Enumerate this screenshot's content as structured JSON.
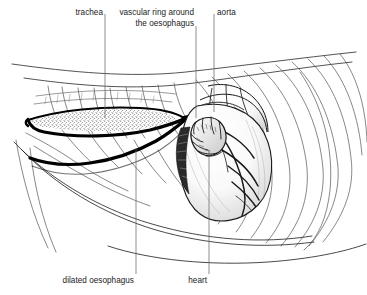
{
  "figure": {
    "background_color": "#ffffff",
    "ink_color": "#1a1a1a",
    "heavy_ink_color": "#000000",
    "width": 367,
    "height": 295
  },
  "labels": [
    {
      "id": "trachea",
      "text": "trachea",
      "align": "right",
      "text_x": 103,
      "text_y": 8,
      "leader": {
        "x1": 105,
        "y1": 14,
        "x2": 105,
        "y2": 118
      }
    },
    {
      "id": "vascular-ring",
      "text": "vascular ring around\nthe oesophagus",
      "line1": "vascular ring around",
      "line2": "the oesophagus",
      "align": "right",
      "text_x": 194,
      "text_y": 8,
      "leader": {
        "x1": 196,
        "y1": 26,
        "x2": 196,
        "y2": 118
      }
    },
    {
      "id": "aorta",
      "text": "aorta",
      "align": "left",
      "text_x": 217,
      "text_y": 8,
      "leader": {
        "x1": 214,
        "y1": 14,
        "x2": 214,
        "y2": 112
      }
    },
    {
      "id": "dilated-oesophagus",
      "text": "dilated oesophagus",
      "align": "right",
      "text_x": 134,
      "text_y": 276,
      "leader": {
        "x1": 136,
        "y1": 148,
        "x2": 136,
        "y2": 274
      }
    },
    {
      "id": "heart",
      "text": "heart",
      "align": "right",
      "text_x": 207,
      "text_y": 276,
      "leader": {
        "x1": 209,
        "y1": 150,
        "x2": 209,
        "y2": 274
      }
    }
  ],
  "structures": [
    {
      "id": "thoracic-wall",
      "name": "thoracic wall and vertebral column"
    },
    {
      "id": "rib-cage",
      "name": "ribs"
    },
    {
      "id": "sternum",
      "name": "sternum"
    },
    {
      "id": "dilated-oesophagus-body",
      "name": "dilated oesophagus (stippled lumen)"
    },
    {
      "id": "oesophagus-constriction",
      "name": "oesophageal constriction at vascular ring"
    },
    {
      "id": "caudal-oesophagus",
      "name": "caudal oesophagus"
    },
    {
      "id": "heart-body",
      "name": "heart"
    },
    {
      "id": "auricle",
      "name": "right auricle"
    },
    {
      "id": "coronary-vessels",
      "name": "coronary vessels"
    },
    {
      "id": "aortic-arch",
      "name": "aortic arch"
    },
    {
      "id": "trachea-body",
      "name": "trachea"
    },
    {
      "id": "diaphragm",
      "name": "diaphragm"
    }
  ]
}
